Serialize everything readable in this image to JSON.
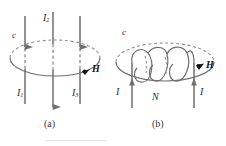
{
  "figure": {
    "title_caption_a": "(a)",
    "title_caption_b": "(b)",
    "stroke_color": "#6f6f6f",
    "dash_color": "#8d8d8d",
    "text_color": "#2b2b2b",
    "accent_color": "#111111"
  },
  "panel_a": {
    "caption": "(a)",
    "loop_label": "c",
    "field_label": "H",
    "wires": [
      {
        "name": "I1",
        "symbol": "I",
        "subscript": "1",
        "direction": "up",
        "label_position": "bottom-left"
      },
      {
        "name": "I2",
        "symbol": "I",
        "subscript": "2",
        "direction": "down",
        "label_position": "top-center"
      },
      {
        "name": "I3",
        "symbol": "I",
        "subscript": "3",
        "direction": "up",
        "label_position": "bottom-right"
      }
    ]
  },
  "panel_b": {
    "caption": "(b)",
    "loop_label": "c",
    "field_label": "H",
    "turns_label": "N",
    "current_left_label": "I",
    "current_right_label": "I",
    "current_left_direction": "up",
    "current_right_direction": "up",
    "coil_turns": 3
  }
}
